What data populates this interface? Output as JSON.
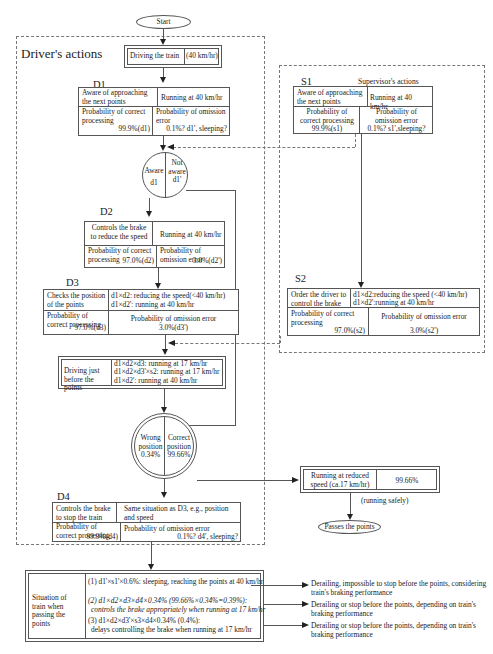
{
  "start": {
    "label": "Start"
  },
  "driver_region": {
    "title": "Driver's actions"
  },
  "supervisor_region": {
    "title": "Supervisor's actions"
  },
  "driving_train": {
    "label": "Driving the train",
    "speed": "(40 km/hr)"
  },
  "d1": {
    "id": "D1",
    "action": "Aware of approaching the next points",
    "state": "Running at 40 km/hr",
    "correct_label": "Probability of correct processing",
    "correct_value": "99.9%(d1)",
    "omission_label": "Probability of omission error",
    "omission_value": "0.1%? d1', sleeping?"
  },
  "aware_circle": {
    "left_label": "Aware",
    "left_sub": "d1",
    "right_label": "Not aware",
    "right_sub": "d1'"
  },
  "d2": {
    "id": "D2",
    "action": "Controls the brake to reduce the speed",
    "state": "Running at 40 km/hr",
    "correct_label": "Probability of correct processing",
    "correct_value": "97.0%(d2)",
    "omission_label": "Probability of omission error",
    "omission_value": "3.0%(d2')"
  },
  "d3": {
    "id": "D3",
    "action": "Checks the position of the points",
    "state_line1": "d1×d2: reducing the speed(<40 km/hr)",
    "state_line2": "d1×d2': running at 40 km/hr",
    "correct_label": "Probability of correct processing",
    "correct_value": "97.0%(d3)",
    "omission_label": "Probability of omission error",
    "omission_value": "3.0%(d3')"
  },
  "driving_before": {
    "label": "Driving just before the points",
    "line1": "d1×d2×d3: running at 17 km/hr",
    "line2": "d1×d2×d3'×s2: running at 17 km/hr",
    "line3": "d1×d2': running at 40 km/hr"
  },
  "position_circle": {
    "left_label": "Wrong position",
    "left_value": "0.34%",
    "right_label": "Correct position",
    "right_value": "99.66%"
  },
  "reduced_speed": {
    "label": "Running at reduced speed (ca.17 km/hr)",
    "value": "99.66%",
    "note": "(running safely)"
  },
  "passes": {
    "label": "Passes the points"
  },
  "d4": {
    "id": "D4",
    "action": "Controls the brake to stop the train",
    "state": "Same situation as D3, e.g., position and speed",
    "correct_label": "Probability of correct processing",
    "correct_value": "99.9%(d4)",
    "omission_label": "Probability of omission error",
    "omission_value": "0.1%?  d4', sleeping?"
  },
  "s1": {
    "id": "S1",
    "action": "Aware of approaching the next points",
    "state": "Running at 40 km/hr",
    "correct_label": "Probability of correct processing",
    "correct_value": "99.9%(s1)",
    "omission_label": "Probability of omission error",
    "omission_value": "0.1%? s1',sleeping?"
  },
  "s2": {
    "id": "S2",
    "action": "Order the driver to control the brake",
    "state_line1": "d1×d2:reducing the speed (<40 km/hr)",
    "state_line2": "d1×d2':running at 40 km/hr",
    "correct_label": "Probability of correct processing",
    "correct_value": "97.0%(s2)",
    "omission_label": "Probability of omission error",
    "omission_value": "3.0%(s2')"
  },
  "situation": {
    "label": "Situation of train when passing the points",
    "items": [
      {
        "text": "(1) d1'×s1'×0.6%: sleeping, reaching the points at 40 km/hr",
        "outcome": "Derailing, impossible to stop before the points, considering train's braking performance"
      },
      {
        "text": "(2) d1×d2×d3×d4×0.34% (99.66%×0.34%=0.39%):",
        "text2": "controls the brake appropriately when running at 17 km/hr",
        "outcome": "Derailing or stop before the points, depending on train's braking performance"
      },
      {
        "text": "(3) d1×d2×d3'×s3×d4×0.34% (0.4%):",
        "text2": "delays controlling the brake when running at 17 km/hr",
        "outcome": "Derailing or stop before the points, depending on train's braking performance"
      }
    ]
  }
}
